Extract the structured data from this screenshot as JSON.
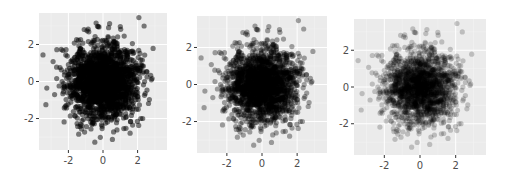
{
  "chart_data": [
    {
      "type": "scatter",
      "title": "",
      "xlabel": "",
      "ylabel": "",
      "xlim": [
        -3.7,
        3.7
      ],
      "ylim": [
        -3.7,
        3.7
      ],
      "x_ticks": [
        -2,
        0,
        2
      ],
      "y_ticks": [
        -2,
        0,
        2
      ],
      "x_tick_labels": [
        "-2",
        "0",
        "2"
      ],
      "y_tick_labels": [
        "-2",
        "0",
        "2"
      ],
      "grid": true,
      "legend": "none",
      "point_color": "#000000",
      "point_alpha": 0.5,
      "distribution": "bivariate standard normal, ~2000 points",
      "n_points": 2000,
      "seed": 11
    },
    {
      "type": "scatter",
      "title": "",
      "xlabel": "",
      "ylabel": "",
      "xlim": [
        -3.7,
        3.7
      ],
      "ylim": [
        -3.7,
        3.7
      ],
      "x_ticks": [
        -2,
        0,
        2
      ],
      "y_ticks": [
        -2,
        0,
        2
      ],
      "x_tick_labels": [
        "-2",
        "0",
        "2"
      ],
      "y_tick_labels": [
        "-2",
        "0",
        "2"
      ],
      "grid": true,
      "legend": "none",
      "point_color": "#000000",
      "point_alpha": 0.35,
      "distribution": "bivariate standard normal, ~2000 points",
      "n_points": 2000,
      "seed": 11
    },
    {
      "type": "scatter",
      "title": "",
      "xlabel": "",
      "ylabel": "",
      "xlim": [
        -3.7,
        3.7
      ],
      "ylim": [
        -3.7,
        3.7
      ],
      "x_ticks": [
        -2,
        0,
        2
      ],
      "y_ticks": [
        -2,
        0,
        2
      ],
      "x_tick_labels": [
        "-2",
        "0",
        "2"
      ],
      "y_tick_labels": [
        "-2",
        "0",
        "2"
      ],
      "grid": true,
      "legend": "none",
      "point_color": "#000000",
      "point_alpha": 0.2,
      "distribution": "bivariate standard normal, ~2000 points",
      "n_points": 2000,
      "seed": 11
    }
  ],
  "style": {
    "panel_background": "#ebebeb",
    "grid_major_color": "#ffffff",
    "grid_minor_color": "#f5f5f5",
    "tick_color": "#333333"
  }
}
